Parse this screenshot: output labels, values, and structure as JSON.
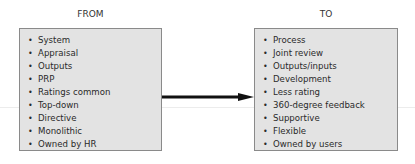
{
  "from": {
    "heading": "FROM",
    "items": [
      "System",
      "Appraisal",
      "Outputs",
      "PRP",
      "Ratings common",
      "Top-down",
      "Directive",
      "Monolithic",
      "Owned by HR"
    ]
  },
  "to": {
    "heading": "TO",
    "items": [
      "Process",
      "Joint review",
      "Outputs/inputs",
      "Development",
      "Less rating",
      "360-degree feedback",
      "Supportive",
      "Flexible",
      "Owned by users"
    ]
  },
  "colors": {
    "box_fill": "#e3e3e3",
    "box_border": "#8a8a8a",
    "arrow": "#111111"
  }
}
